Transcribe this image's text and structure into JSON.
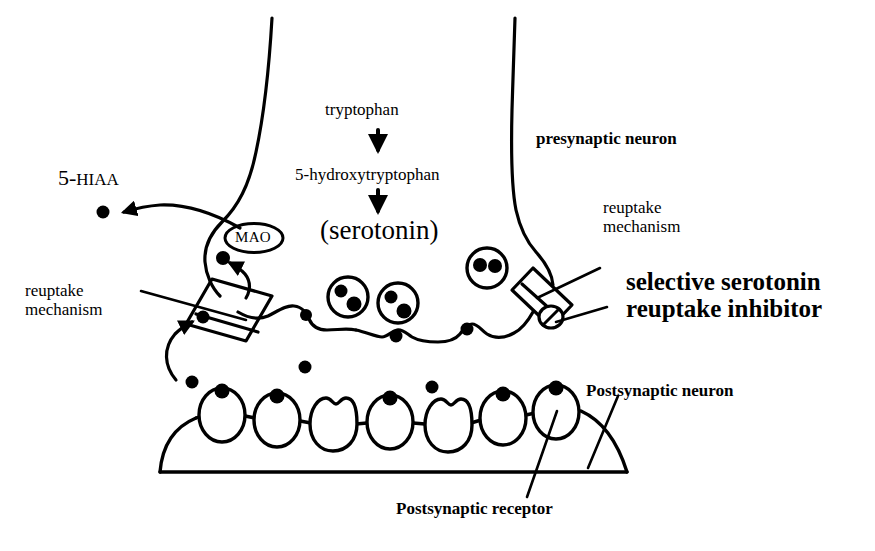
{
  "figure": {
    "ink_color": "#000000",
    "background_color": "#ffffff"
  },
  "labels": {
    "tryptophan": "tryptophan",
    "hydroxytryptophan": "5-hydroxytryptophan",
    "serotonin": "(serotonin)",
    "mao": "MAO",
    "hiaa_prefix": "5-",
    "hiaa_suffix": "HIAA",
    "presynaptic_neuron": "presynaptic neuron",
    "reuptake_mechanism_left": "reuptake\nmechanism",
    "reuptake_mechanism_right": "reuptake\nmechanism",
    "ssri": "selective serotonin\nreuptake inhibitor",
    "postsynaptic_neuron": "Postsynaptic neuron",
    "postsynaptic_receptor": "Postsynaptic receptor"
  },
  "icons": {
    "arrow_down_1": "arrow-down-icon",
    "arrow_down_2": "arrow-down-icon",
    "hiaa_arrow": "curved-arrow-left-icon",
    "uptake_arrow": "curved-arrow-up-icon",
    "mao_arrow": "arrow-up-icon"
  },
  "diagram_data": {
    "type": "biological-schematic",
    "presynaptic_terminal": {
      "description": "Funnel-shaped presynaptic axon terminal containing serotonin vesicles",
      "vesicles": [
        {
          "cx": 348,
          "cy": 297,
          "r": 20,
          "granules": 2
        },
        {
          "cx": 398,
          "cy": 303,
          "r": 20,
          "granules": 2
        },
        {
          "cx": 487,
          "cy": 268,
          "r": 20,
          "granules": 2
        }
      ],
      "membrane_bumps": [
        {
          "cx": 309,
          "cy": 318,
          "granule": true
        },
        {
          "cx": 397,
          "cy": 330,
          "granule": true
        },
        {
          "cx": 466,
          "cy": 323,
          "granule": true
        }
      ]
    },
    "transporters": [
      {
        "name": "left-reuptake-transporter",
        "cx": 228,
        "cy": 305,
        "blocked": false
      },
      {
        "name": "right-reuptake-transporter",
        "cx": 541,
        "cy": 297,
        "blocked": true
      }
    ],
    "mao_enzyme": {
      "cx": 254,
      "cy": 238,
      "rx": 28,
      "ry": 14
    },
    "free_serotonin_cleft": [
      {
        "cx": 192,
        "cy": 382
      },
      {
        "cx": 305,
        "cy": 367
      },
      {
        "cx": 432,
        "cy": 387
      }
    ],
    "metabolite_5hiaa": {
      "cx": 103,
      "cy": 212
    },
    "postsynaptic_receptors": [
      {
        "index": 1,
        "cx": 222,
        "cy": 415,
        "occupied": true
      },
      {
        "index": 2,
        "cx": 277,
        "cy": 420,
        "occupied": true
      },
      {
        "index": 3,
        "cx": 333,
        "cy": 424,
        "occupied": false
      },
      {
        "index": 4,
        "cx": 390,
        "cy": 422,
        "occupied": true
      },
      {
        "index": 5,
        "cx": 448,
        "cy": 425,
        "occupied": false
      },
      {
        "index": 6,
        "cx": 503,
        "cy": 418,
        "occupied": true
      },
      {
        "index": 7,
        "cx": 556,
        "cy": 412,
        "occupied": true
      }
    ],
    "counts": {
      "vesicles": 3,
      "receptors": 7,
      "occupied_receptors": 5,
      "free_serotonin_in_cleft": 3
    }
  }
}
